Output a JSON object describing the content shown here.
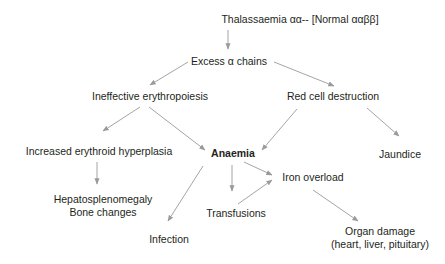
{
  "diagram": {
    "type": "flowchart",
    "title": "Thalassaemia αα--  [Normal ααββ]",
    "colors": {
      "text": "#231f20",
      "arrow": "#9a9a9a",
      "background": "#ffffff"
    },
    "nodes": {
      "root": {
        "label": "Thalassaemia αα--  [Normal ααββ]"
      },
      "excess": {
        "label": "Excess α chains"
      },
      "ineffective": {
        "label": "Ineffective erythropoiesis"
      },
      "redcell": {
        "label": "Red cell destruction"
      },
      "hyperplasia": {
        "label": "Increased erythroid hyperplasia"
      },
      "anaemia": {
        "label": "Anaemia"
      },
      "jaundice": {
        "label": "Jaundice"
      },
      "hepato": {
        "line1": "Hepatosplenomegaly",
        "line2": "Bone changes"
      },
      "iron": {
        "label": "Iron overload"
      },
      "transfusions": {
        "label": "Transfusions"
      },
      "infection": {
        "label": "Infection"
      },
      "organ": {
        "line1": "Organ damage",
        "line2": "(heart, liver, pituitary)"
      }
    },
    "edges": [
      {
        "from": "root",
        "to": "excess"
      },
      {
        "from": "excess",
        "to": "ineffective"
      },
      {
        "from": "excess",
        "to": "redcell"
      },
      {
        "from": "ineffective",
        "to": "hyperplasia"
      },
      {
        "from": "ineffective",
        "to": "anaemia"
      },
      {
        "from": "redcell",
        "to": "anaemia"
      },
      {
        "from": "redcell",
        "to": "jaundice"
      },
      {
        "from": "hyperplasia",
        "to": "hepato"
      },
      {
        "from": "anaemia",
        "to": "infection"
      },
      {
        "from": "anaemia",
        "to": "transfusions"
      },
      {
        "from": "anaemia",
        "to": "iron"
      },
      {
        "from": "transfusions",
        "to": "iron"
      },
      {
        "from": "iron",
        "to": "organ"
      }
    ]
  }
}
